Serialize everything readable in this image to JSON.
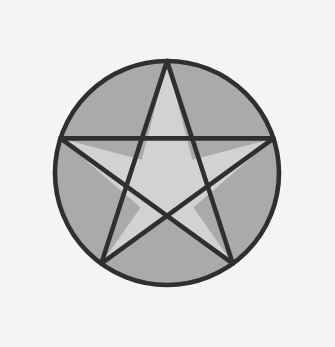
{
  "canvas": {
    "width": 335,
    "height": 347,
    "background_color": "#f4f4f2",
    "paper_tint_color": "#f7f7f5",
    "title": "Pentagram"
  },
  "figure": {
    "name": "pentagram",
    "stroke_color": "#2f2f2f",
    "stroke_width": 4.6,
    "circle": {
      "center_x": 167,
      "center_y": 173,
      "radius": 112,
      "fill_color": "#aaaaaa"
    },
    "star": {
      "fill_color": "#d2d2d2",
      "points": 5,
      "outer_radius": 112,
      "inner_radius": 42.8,
      "rotation_degrees": -90,
      "outer_vertices": [
        {
          "label": "top",
          "x": 167,
          "y": 61
        },
        {
          "label": "right",
          "x": 273.5,
          "y": 138.4
        },
        {
          "label": "bottom-right",
          "x": 232.8,
          "y": 263.6
        },
        {
          "label": "bottom-left",
          "x": 101.2,
          "y": 263.6
        },
        {
          "label": "left",
          "x": 60.5,
          "y": 138.4
        }
      ],
      "inner_vertices": [
        {
          "label": "upper-right",
          "x": 192.2,
          "y": 159.8
        },
        {
          "label": "lower-right",
          "x": 193.4,
          "y": 207.6
        },
        {
          "label": "bottom",
          "x": 167,
          "y": 215.8
        },
        {
          "label": "lower-left",
          "x": 140.6,
          "y": 207.6
        },
        {
          "label": "upper-left",
          "x": 141.8,
          "y": 159.8
        }
      ]
    },
    "chords": [
      {
        "name": "chord-top-to-bottom-right",
        "from": "top",
        "to": "bottom-right"
      },
      {
        "name": "chord-bottom-right-to-left",
        "from": "bottom-right",
        "to": "left"
      },
      {
        "name": "chord-left-to-right",
        "from": "left",
        "to": "right"
      },
      {
        "name": "chord-right-to-bottom-left",
        "from": "right",
        "to": "bottom-left"
      },
      {
        "name": "chord-bottom-left-to-top",
        "from": "bottom-left",
        "to": "top"
      }
    ]
  }
}
